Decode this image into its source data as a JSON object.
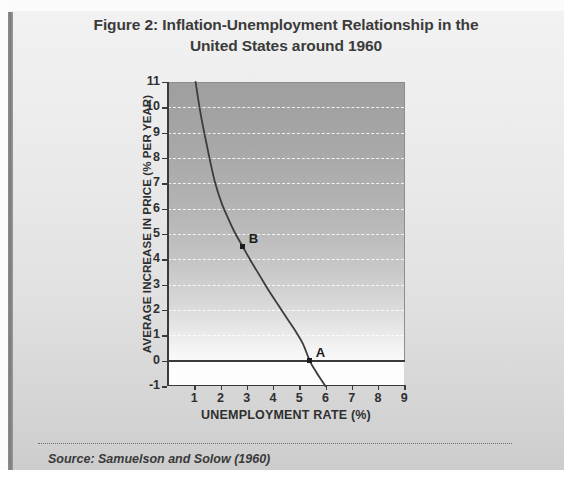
{
  "figure": {
    "title_line1": "Figure 2: Inflation-Unemployment Relationship in the",
    "title_line2": "United States around 1960",
    "source": "Source: Samuelson and Solow (1960)"
  },
  "chart_data": {
    "type": "line",
    "title": "Figure 2: Inflation-Unemployment Relationship in the United States around 1960",
    "xlabel": "UNEMPLOYMENT RATE (%)",
    "ylabel": "AVERAGE INCREASE IN PRICE (% PER YEAR)",
    "xlim": [
      0,
      9.4
    ],
    "ylim": [
      -1,
      11
    ],
    "xticks": [
      1,
      2,
      3,
      4,
      5,
      6,
      7,
      8,
      9
    ],
    "yticks": [
      -1,
      0,
      1,
      2,
      3,
      4,
      5,
      6,
      7,
      8,
      9,
      10,
      11
    ],
    "xtick_labels": [
      "1",
      "2",
      "3",
      "4",
      "5",
      "6",
      "7",
      "8",
      "9"
    ],
    "ytick_labels": [
      "11",
      "10",
      "9",
      "8",
      "7",
      "6",
      "5",
      "4",
      "3",
      "2",
      "1",
      "0",
      "-1"
    ],
    "grid": "horizontal-dashed-white",
    "legend": "none",
    "series": [
      {
        "name": "Phillips curve",
        "color": "#3c3c3c",
        "points": [
          [
            1.05,
            11.0
          ],
          [
            1.2,
            10.0
          ],
          [
            1.38,
            9.0
          ],
          [
            1.58,
            8.0
          ],
          [
            1.8,
            7.0
          ],
          [
            2.05,
            6.2
          ],
          [
            2.3,
            5.6
          ],
          [
            2.55,
            5.05
          ],
          [
            2.85,
            4.5
          ],
          [
            3.15,
            3.95
          ],
          [
            3.5,
            3.35
          ],
          [
            3.85,
            2.75
          ],
          [
            4.2,
            2.2
          ],
          [
            4.55,
            1.65
          ],
          [
            4.9,
            1.1
          ],
          [
            5.15,
            0.65
          ],
          [
            5.4,
            0.0
          ],
          [
            5.65,
            -0.45
          ],
          [
            6.0,
            -1.0
          ]
        ]
      }
    ],
    "annotations": [
      {
        "label": "A",
        "x": 5.4,
        "y": 0.0
      },
      {
        "label": "B",
        "x": 2.85,
        "y": 4.5
      }
    ]
  }
}
